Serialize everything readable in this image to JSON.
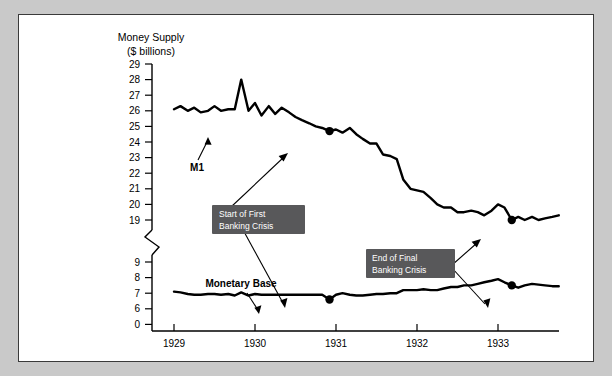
{
  "figure": {
    "background_color": "#c9c9c9",
    "panel_color": "#ffffff",
    "border_color": "#3a3a3a",
    "callout_color": "#58585a"
  },
  "chart_data": {
    "type": "line",
    "title": "",
    "ylabel_line1": "Money Supply",
    "ylabel_line2": "($ billions)",
    "xlabel": "",
    "grid": false,
    "legend": "inline-labels",
    "axis_break": true,
    "axis_break_note": "y-axis broken between 19 and 9",
    "y_ticks_upper": [
      29,
      28,
      27,
      26,
      25,
      24,
      23,
      22,
      21,
      20,
      19
    ],
    "y_ticks_lower": [
      9,
      8,
      7,
      6
    ],
    "y_origin_label": 0,
    "x_ticks": [
      1929,
      1930,
      1931,
      1932,
      1933
    ],
    "xlim": [
      1928.92,
      1933.85
    ],
    "series": [
      {
        "name": "M1",
        "label": "M1",
        "x": [
          1929.0,
          1929.08,
          1929.17,
          1929.25,
          1929.33,
          1929.42,
          1929.5,
          1929.58,
          1929.67,
          1929.75,
          1929.83,
          1929.92,
          1930.0,
          1930.08,
          1930.17,
          1930.25,
          1930.33,
          1930.42,
          1930.5,
          1930.58,
          1930.67,
          1930.75,
          1930.83,
          1930.92,
          1931.0,
          1931.08,
          1931.17,
          1931.25,
          1931.33,
          1931.42,
          1931.5,
          1931.58,
          1931.67,
          1931.75,
          1931.83,
          1931.92,
          1932.0,
          1932.08,
          1932.17,
          1932.25,
          1932.33,
          1932.42,
          1932.5,
          1932.58,
          1932.67,
          1932.75,
          1932.83,
          1932.92,
          1933.0,
          1933.08,
          1933.17,
          1933.25,
          1933.33,
          1933.42,
          1933.5,
          1933.58,
          1933.67,
          1933.75
        ],
        "values": [
          26.1,
          26.3,
          26.0,
          26.2,
          25.9,
          26.0,
          26.3,
          26.0,
          26.1,
          26.1,
          28.0,
          26.0,
          26.5,
          25.7,
          26.3,
          25.8,
          26.2,
          25.9,
          25.6,
          25.4,
          25.2,
          25.0,
          24.9,
          24.7,
          24.8,
          24.6,
          24.9,
          24.5,
          24.2,
          23.9,
          23.9,
          23.2,
          23.1,
          22.9,
          21.6,
          21.0,
          20.9,
          20.8,
          20.4,
          20.0,
          19.8,
          19.8,
          19.5,
          19.5,
          19.6,
          19.5,
          19.3,
          19.6,
          20.0,
          19.8,
          19.0,
          19.2,
          19.0,
          19.2,
          19.0,
          19.1,
          19.2,
          19.3
        ],
        "markers": [
          {
            "x": 1930.92,
            "y": 24.7,
            "note": "Start of First Banking Crisis"
          },
          {
            "x": 1933.17,
            "y": 19.0,
            "note": "End of Final Banking Crisis"
          }
        ]
      },
      {
        "name": "Monetary Base",
        "label": "Monetary Base",
        "x": [
          1929.0,
          1929.08,
          1929.17,
          1929.25,
          1929.33,
          1929.42,
          1929.5,
          1929.58,
          1929.67,
          1929.75,
          1929.83,
          1929.92,
          1930.0,
          1930.08,
          1930.17,
          1930.25,
          1930.33,
          1930.42,
          1930.5,
          1930.58,
          1930.67,
          1930.75,
          1930.83,
          1930.92,
          1931.0,
          1931.08,
          1931.17,
          1931.25,
          1931.33,
          1931.42,
          1931.5,
          1931.58,
          1931.67,
          1931.75,
          1931.83,
          1931.92,
          1932.0,
          1932.08,
          1932.17,
          1932.25,
          1932.33,
          1932.42,
          1932.5,
          1932.58,
          1932.67,
          1932.75,
          1932.83,
          1932.92,
          1933.0,
          1933.08,
          1933.17,
          1933.25,
          1933.33,
          1933.42,
          1933.5,
          1933.58,
          1933.67,
          1933.75
        ],
        "values": [
          7.1,
          7.05,
          6.95,
          6.9,
          6.9,
          6.95,
          6.95,
          6.9,
          6.95,
          6.85,
          7.05,
          6.85,
          6.95,
          6.9,
          6.9,
          6.9,
          6.9,
          6.9,
          6.9,
          6.9,
          6.9,
          6.9,
          6.9,
          6.6,
          6.9,
          7.0,
          6.9,
          6.85,
          6.85,
          6.9,
          6.95,
          6.95,
          7.0,
          7.0,
          7.2,
          7.2,
          7.2,
          7.25,
          7.2,
          7.2,
          7.3,
          7.4,
          7.4,
          7.5,
          7.5,
          7.6,
          7.7,
          7.8,
          7.9,
          7.7,
          7.5,
          7.35,
          7.5,
          7.6,
          7.55,
          7.5,
          7.45,
          7.45
        ],
        "markers": [
          {
            "x": 1930.92,
            "y": 6.6,
            "note": "Start of First Banking Crisis"
          },
          {
            "x": 1933.17,
            "y": 7.5,
            "note": "End of Final Banking Crisis"
          }
        ]
      }
    ],
    "annotations": [
      {
        "id": "start-first-banking-crisis",
        "line1": "Start of First",
        "line2": "Banking Crisis",
        "targets": [
          "M1 at 1930.92",
          "Monetary Base at 1930.92"
        ]
      },
      {
        "id": "end-final-banking-crisis",
        "line1": "End of Final",
        "line2": "Banking Crisis",
        "targets": [
          "M1 at 1933.17",
          "Monetary Base at 1933.17"
        ]
      }
    ]
  }
}
